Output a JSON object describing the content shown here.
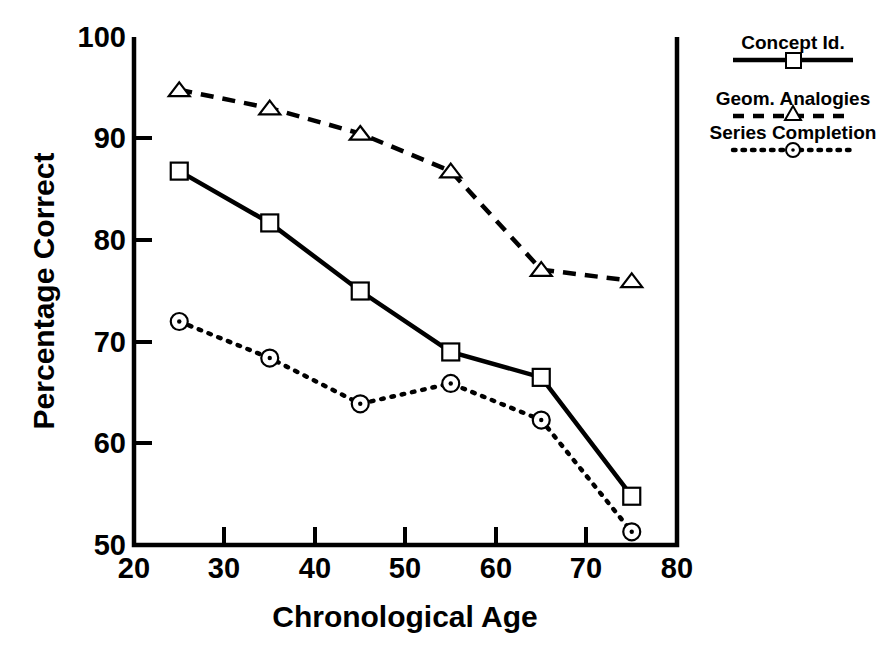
{
  "chart_data": {
    "type": "line",
    "title": "",
    "xlabel": "Chronological Age",
    "ylabel": "Percentage Correct",
    "xlim": [
      20,
      80
    ],
    "ylim": [
      50,
      100
    ],
    "xticks": [
      20,
      30,
      40,
      50,
      60,
      70,
      80
    ],
    "yticks": [
      50,
      60,
      70,
      80,
      90,
      100
    ],
    "grid": false,
    "legend_position": "outside-right-top",
    "x": [
      25,
      35,
      45,
      55,
      65,
      75
    ],
    "series": [
      {
        "name": "Concept Id.",
        "marker": "square",
        "linestyle": "solid",
        "color": "#000000",
        "values": [
          86.8,
          81.7,
          75.0,
          69.0,
          66.5,
          54.8
        ]
      },
      {
        "name": "Geom. Analogies",
        "marker": "triangle",
        "linestyle": "dashed",
        "color": "#000000",
        "values": [
          94.8,
          93.0,
          90.5,
          86.8,
          77.1,
          76.0
        ]
      },
      {
        "name": "Series Completion",
        "marker": "circle-dot",
        "linestyle": "dotted",
        "color": "#000000",
        "values": [
          72.0,
          68.4,
          63.9,
          65.9,
          62.3,
          51.3
        ]
      }
    ]
  },
  "axes": {
    "y_label": "Percentage Correct",
    "x_label": "Chronological Age",
    "y_tick_labels": [
      "100",
      "90",
      "80",
      "70",
      "60",
      "50"
    ],
    "x_tick_labels": [
      "20",
      "30",
      "40",
      "50",
      "60",
      "70",
      "80"
    ]
  },
  "legend": {
    "items": [
      {
        "label": "Concept Id.",
        "marker": "square-marker",
        "line": "solid-line"
      },
      {
        "label": "Geom. Analogies",
        "marker": "triangle-marker",
        "line": "dashed-line"
      },
      {
        "label": "Series Completion",
        "marker": "circle-dot-marker",
        "line": "dotted-line"
      }
    ]
  }
}
